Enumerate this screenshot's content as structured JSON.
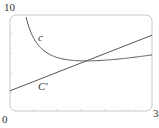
{
  "chart_data": {
    "type": "line",
    "title": "",
    "xlabel": "",
    "ylabel": "",
    "xlim": [
      0,
      3
    ],
    "ylim": [
      0,
      10
    ],
    "grid": false,
    "legend": "none (inline curve labels)",
    "tick_labels": {
      "y_top": "10",
      "origin": "0",
      "x_right": "3"
    },
    "series": [
      {
        "name": "c",
        "label": "c",
        "description": "average cost curve, decreasing then slowly increasing",
        "x": [
          0.34,
          0.5,
          0.75,
          1.0,
          1.25,
          1.5,
          1.75,
          2.0,
          2.5,
          3.0
        ],
        "values": [
          9.8,
          7.6,
          6.1,
          5.5,
          5.3,
          5.2,
          5.2,
          5.3,
          5.5,
          5.8
        ]
      },
      {
        "name": "C'",
        "label": "C'",
        "description": "marginal cost, straight line",
        "x": [
          0,
          3
        ],
        "values": [
          2.1,
          7.9
        ]
      }
    ],
    "annotations": [
      {
        "text": "c",
        "x": 0.75,
        "y": 7.5
      },
      {
        "text": "C'",
        "x": 0.85,
        "y": 2.4
      }
    ]
  },
  "colors": {
    "frame": "#c8c8c8",
    "curve": "#555555",
    "text": "#333333"
  }
}
